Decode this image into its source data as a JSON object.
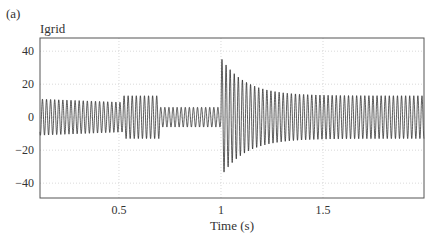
{
  "figure": {
    "panel_label": "(a)",
    "signal_label": "Igrid"
  },
  "chart_data": {
    "type": "line",
    "title": "Igrid",
    "panel": "(a)",
    "xlabel": "Time (s)",
    "ylabel": "",
    "xlim": [
      0.113,
      1.995
    ],
    "ylim": [
      -49,
      48
    ],
    "xticks": [
      0.5,
      1,
      1.5
    ],
    "xtick_labels": [
      "0.5",
      "1",
      "1.5"
    ],
    "yticks": [
      40,
      20,
      0,
      -20,
      -40
    ],
    "ytick_labels": [
      "40",
      "20",
      "0",
      "−20",
      "−40"
    ],
    "grid": true,
    "legend": null,
    "series": [
      {
        "name": "Igrid",
        "color": "#1a1a1a",
        "description": "Oscillating grid current (sinusoid, ~50 Hz) with changing envelope",
        "envelope_segments": [
          {
            "t_start": 0.113,
            "t_end": 0.52,
            "amplitude_start": 11,
            "amplitude_end": 9
          },
          {
            "t_start": 0.52,
            "t_end": 0.7,
            "amplitude_start": 13,
            "amplitude_end": 13
          },
          {
            "t_start": 0.7,
            "t_end": 1.0,
            "amplitude_start": 6,
            "amplitude_end": 6
          },
          {
            "t_start": 1.0,
            "t_end": 1.995,
            "amplitude_start": 36,
            "amplitude_end": 13,
            "decay": "exponential",
            "tau_s": 0.12
          }
        ],
        "peak_max": 35,
        "peak_min": -37,
        "frequency_hz": 50
      }
    ]
  }
}
